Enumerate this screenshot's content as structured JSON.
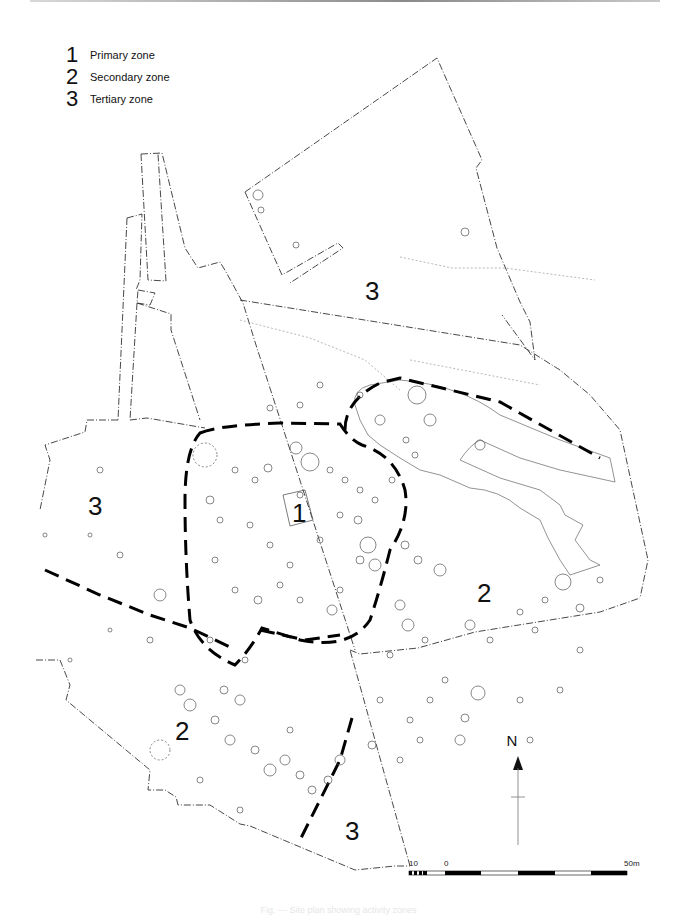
{
  "legend": {
    "items": [
      {
        "number": "1",
        "label": "Primary zone"
      },
      {
        "number": "2",
        "label": "Secondary zone"
      },
      {
        "number": "3",
        "label": "Tertiary zone"
      }
    ]
  },
  "map": {
    "zone_labels": [
      {
        "id": "zone-3-north",
        "text": "3",
        "x": 365,
        "y": 300
      },
      {
        "id": "zone-3-west",
        "text": "3",
        "x": 88,
        "y": 515
      },
      {
        "id": "zone-1-center",
        "text": "1",
        "x": 292,
        "y": 522
      },
      {
        "id": "zone-2-east",
        "text": "2",
        "x": 477,
        "y": 602
      },
      {
        "id": "zone-2-southwest",
        "text": "2",
        "x": 175,
        "y": 740
      },
      {
        "id": "zone-3-south",
        "text": "3",
        "x": 345,
        "y": 840
      }
    ],
    "colors": {
      "ink": "#111111",
      "trench_edge": "#333333",
      "feature": "#555555",
      "contour": "#888888",
      "zone_boundary": "#000000"
    }
  },
  "north_arrow": {
    "label": "N"
  },
  "scale_bar": {
    "labels": {
      "left": "10",
      "zero": "0",
      "right": "50m"
    }
  },
  "caption": {
    "text": "Fig. — Site plan showing activity zones"
  }
}
